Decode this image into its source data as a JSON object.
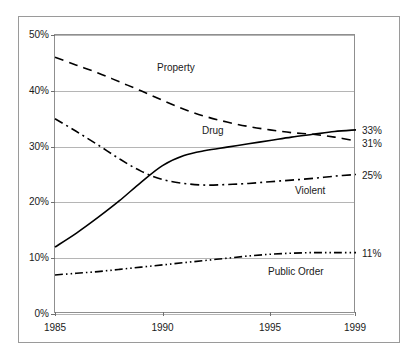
{
  "chart_data": {
    "type": "line",
    "title": "",
    "xlabel": "",
    "ylabel": "",
    "xlim": [
      1985,
      1999
    ],
    "ylim": [
      0,
      50
    ],
    "grid": true,
    "legend_position": "inline-labels",
    "x_ticks": [
      "1985",
      "1990",
      "1995",
      "1999"
    ],
    "x_tick_values": [
      1985,
      1990,
      1995,
      1999
    ],
    "y_ticks": [
      "0%",
      "10%",
      "20%",
      "30%",
      "40%",
      "50%"
    ],
    "y_tick_values": [
      0,
      10,
      20,
      30,
      40,
      50
    ],
    "x": [
      1985,
      1986,
      1987,
      1988,
      1989,
      1990,
      1991,
      1992,
      1993,
      1994,
      1995,
      1996,
      1997,
      1998,
      1999
    ],
    "series": [
      {
        "name": "Property",
        "style": "dashed",
        "end_label": "31%",
        "values": [
          46,
          44.6,
          43.2,
          41.6,
          40.0,
          38.3,
          36.7,
          35.4,
          34.4,
          33.6,
          33.0,
          32.5,
          32.2,
          31.7,
          31
        ]
      },
      {
        "name": "Drug",
        "style": "solid",
        "end_label": "33%",
        "values": [
          12,
          14.5,
          17.3,
          20.3,
          23.6,
          26.6,
          28.4,
          29.3,
          29.9,
          30.5,
          31.1,
          31.7,
          32.2,
          32.7,
          33
        ]
      },
      {
        "name": "Violent",
        "style": "dash-dot",
        "end_label": "25%",
        "values": [
          35,
          32.7,
          30.3,
          27.8,
          25.6,
          24.1,
          23.4,
          23.1,
          23.2,
          23.4,
          23.7,
          24.0,
          24.3,
          24.7,
          25
        ]
      },
      {
        "name": "Public Order",
        "style": "dash-dot-dot",
        "end_label": "11%",
        "values": [
          7,
          7.3,
          7.6,
          8.0,
          8.4,
          8.8,
          9.2,
          9.6,
          10.0,
          10.4,
          10.7,
          10.9,
          11.0,
          11.0,
          11
        ]
      }
    ]
  },
  "colors": {
    "line": "#000000",
    "grid": "#b5b5b5",
    "frame": "#8f8f8f",
    "background": "#ffffff",
    "text": "#1a1a1a"
  }
}
